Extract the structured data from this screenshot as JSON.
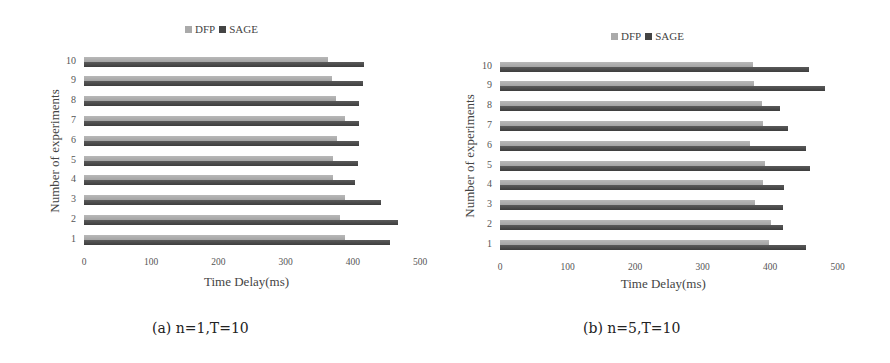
{
  "chart_data": [
    {
      "type": "bar",
      "orientation": "horizontal",
      "caption": "(a) n=1,T=10",
      "title": "",
      "xlabel": "Time Delay(ms)",
      "ylabel": "Number of experiments",
      "xlim": [
        0,
        500
      ],
      "xticks": [
        "0",
        "100",
        "200",
        "300",
        "400",
        "500"
      ],
      "categories": [
        "1",
        "2",
        "3",
        "4",
        "5",
        "6",
        "7",
        "8",
        "9",
        "10"
      ],
      "legend": [
        "DFP",
        "SAGE"
      ],
      "legend_position": "top",
      "grid": false,
      "series": [
        {
          "name": "DFP",
          "color": "#aaaaaa",
          "values": [
            388,
            381,
            388,
            370,
            370,
            377,
            388,
            375,
            369,
            363
          ]
        },
        {
          "name": "SAGE",
          "color": "#444444",
          "values": [
            455,
            467,
            442,
            403,
            408,
            409,
            409,
            409,
            415,
            417
          ]
        }
      ]
    },
    {
      "type": "bar",
      "orientation": "horizontal",
      "caption": "(b) n=5,T=10",
      "title": "",
      "xlabel": "Time Delay(ms)",
      "ylabel": "Number of experiments",
      "xlim": [
        0,
        500
      ],
      "xticks": [
        "0",
        "100",
        "200",
        "300",
        "400",
        "500"
      ],
      "categories": [
        "1",
        "2",
        "3",
        "4",
        "5",
        "6",
        "7",
        "8",
        "9",
        "10"
      ],
      "legend": [
        "DFP",
        "SAGE"
      ],
      "legend_position": "top",
      "grid": false,
      "series": [
        {
          "name": "DFP",
          "color": "#aaaaaa",
          "values": [
            398,
            401,
            378,
            389,
            393,
            370,
            389,
            388,
            376,
            375
          ]
        },
        {
          "name": "SAGE",
          "color": "#444444",
          "values": [
            454,
            419,
            419,
            421,
            459,
            454,
            427,
            415,
            481,
            458
          ]
        }
      ]
    }
  ]
}
